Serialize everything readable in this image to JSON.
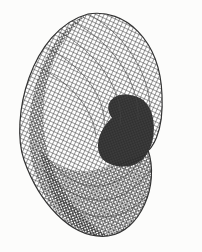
{
  "figure": {
    "colors": {
      "background": "#fcfcfb",
      "mesh": "#3a3a3a",
      "dense_mesh": "#2a2a2a",
      "show_through_text": "#e8e8e6"
    },
    "show_through_lines": [
      "",
      "",
      "",
      "",
      "",
      ""
    ]
  }
}
